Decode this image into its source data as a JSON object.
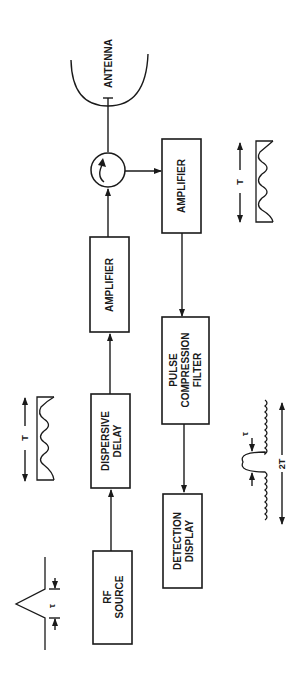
{
  "diagram": {
    "type": "radar pulse compression block diagram",
    "orientation": "rotated 90 degrees counter-clockwise",
    "blocks": [
      {
        "id": "rf_source",
        "lines": [
          "RF",
          "SOURCE"
        ]
      },
      {
        "id": "dispersive_delay",
        "lines": [
          "DISPERSIVE",
          "DELAY"
        ]
      },
      {
        "id": "amplifier_tx",
        "lines": [
          "AMPLIFIER"
        ]
      },
      {
        "id": "amplifier_rx",
        "lines": [
          "AMPLIFIER"
        ]
      },
      {
        "id": "pulse_compression_filter",
        "lines": [
          "PULSE",
          "COMPRESSION",
          "FILTER"
        ]
      },
      {
        "id": "detection_display",
        "lines": [
          "DETECTION",
          "DISPLAY"
        ]
      }
    ],
    "antenna": {
      "label": "ANTENNA"
    },
    "circulator": {
      "label": ""
    },
    "waveforms": {
      "input_pulse": {
        "width_label": "τ"
      },
      "dispersed_pulse_tx": {
        "duration_label": "T"
      },
      "received_pulse": {
        "duration_label": "T"
      },
      "compressed_pulse": {
        "width_label": "τ",
        "span_label": "2T"
      }
    },
    "connections": [
      [
        "rf_source",
        "dispersive_delay"
      ],
      [
        "dispersive_delay",
        "amplifier_tx"
      ],
      [
        "amplifier_tx",
        "circulator"
      ],
      [
        "circulator",
        "antenna"
      ],
      [
        "circulator",
        "amplifier_rx"
      ],
      [
        "amplifier_rx",
        "pulse_compression_filter"
      ],
      [
        "pulse_compression_filter",
        "detection_display"
      ]
    ]
  }
}
